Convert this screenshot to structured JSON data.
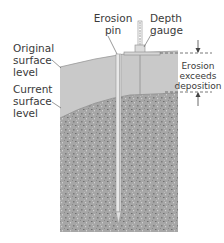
{
  "diagram": {
    "labels": {
      "erosion_pin": "Erosion pin",
      "depth_gauge": "Depth gauge",
      "original_surface": "Original surface level",
      "current_surface": "Current surface level",
      "erosion_note": "Erosion exceeds deposition"
    },
    "lines": {
      "erosion_pin": [
        "Erosion",
        "pin"
      ],
      "depth_gauge": [
        "Depth",
        "gauge"
      ],
      "original_surface": [
        "Original",
        "surface",
        "level"
      ],
      "current_surface": [
        "Current",
        "surface",
        "level"
      ],
      "erosion_note": [
        "Erosion",
        "exceeds",
        "deposition"
      ]
    },
    "colors": {
      "eroded_layer": "#c8c8c8",
      "soil": "#a9a9a9",
      "pin": "#e6e6e6",
      "text": "#3a3a3a",
      "dashed": "#555555"
    }
  }
}
